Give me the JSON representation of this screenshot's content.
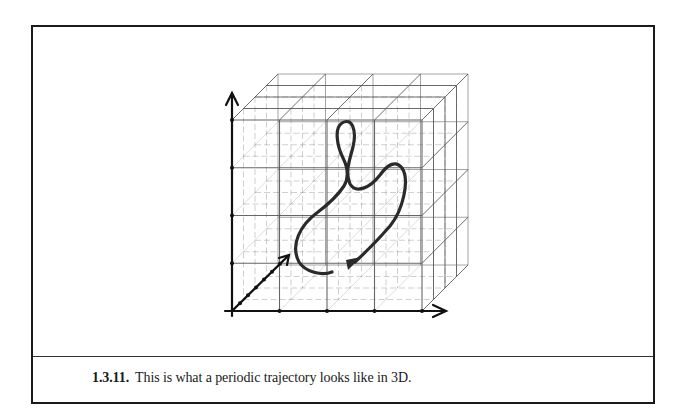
{
  "figure": {
    "number": "1.3.11.",
    "caption": "This is what a periodic trajectory looks like in 3D."
  },
  "chart_data": {
    "type": "diagram",
    "axes": [
      "x (horizontal, arrow right)",
      "y (vertical, arrow up)",
      "z (depth, diagonal arrow)"
    ],
    "grid": {
      "divisions_x": 4,
      "divisions_y": 4,
      "divisions_z": 4
    },
    "curve": {
      "closed": true,
      "arrow": true,
      "style": "thick dark stroke"
    }
  }
}
